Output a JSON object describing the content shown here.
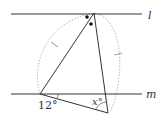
{
  "diagram": {
    "lines": {
      "top": {
        "label": "l"
      },
      "bottom": {
        "label": "m"
      }
    },
    "angles": {
      "left": {
        "label": "12°",
        "value": 12
      },
      "bottom": {
        "label": "x°"
      }
    },
    "colors": {
      "line": "#333333",
      "circle": "#aaaaaa"
    }
  }
}
